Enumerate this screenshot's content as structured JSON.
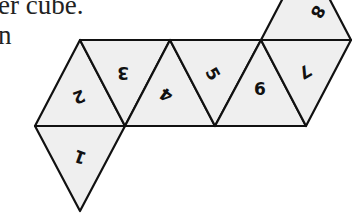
{
  "caption": {
    "line1": "er cube.",
    "line2": "n"
  },
  "net": {
    "description": "Octahedron net of 8 equilateral triangles, numbered 1-8",
    "faces": [
      {
        "id": "1",
        "label": "1",
        "rotation": 200
      },
      {
        "id": "2",
        "label": "2",
        "rotation": 160
      },
      {
        "id": "3",
        "label": "3",
        "rotation": 180
      },
      {
        "id": "4",
        "label": "4",
        "rotation": 210
      },
      {
        "id": "5",
        "label": "5",
        "rotation": 60
      },
      {
        "id": "6",
        "label": "6",
        "rotation": 0
      },
      {
        "id": "7",
        "label": "7",
        "rotation": 150
      },
      {
        "id": "8",
        "label": "8",
        "rotation": 120
      }
    ],
    "colors": {
      "fill": "#efefef",
      "stroke": "#111111"
    }
  }
}
